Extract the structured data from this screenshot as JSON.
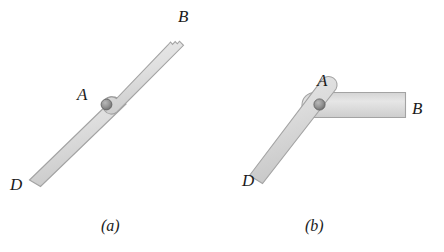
{
  "figure": {
    "background_color": "#ffffff",
    "bar_fill_color": "#dcdcdc",
    "bar_edge_color": "#9a9a9a",
    "pin_color": "#8c8c8c",
    "pin_edge_color": "#5f5f5f",
    "label_color": "#1b1b1b"
  },
  "panel_a": {
    "caption": "(a)",
    "labels": {
      "point_b": "B",
      "point_a": "A",
      "point_d": "D"
    }
  },
  "panel_b": {
    "caption": "(b)",
    "labels": {
      "point_a": "A",
      "point_b": "B",
      "point_d": "D"
    }
  }
}
